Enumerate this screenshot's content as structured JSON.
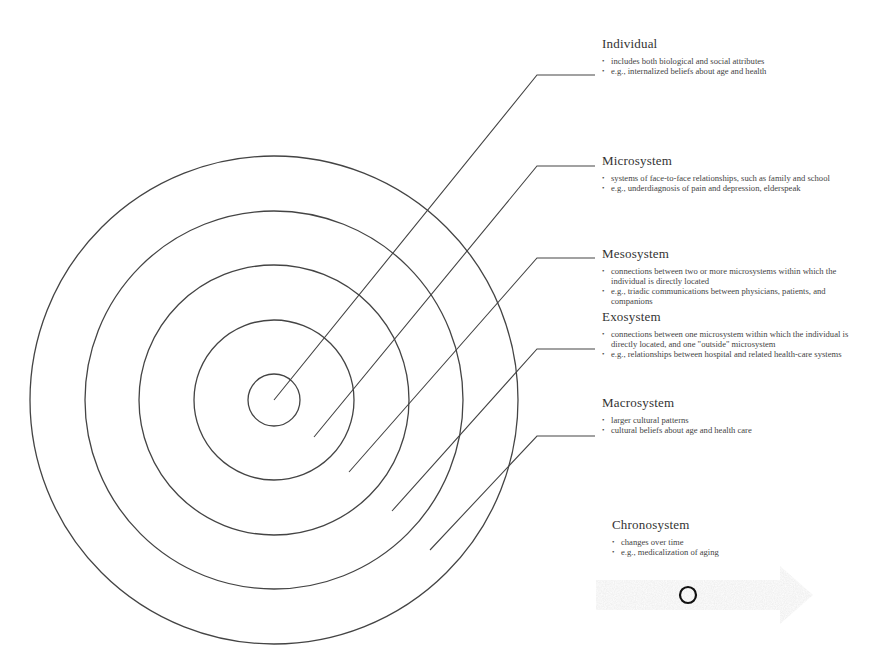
{
  "diagram": {
    "type": "concentric-circles",
    "center": [
      274,
      400
    ],
    "circles": [
      {
        "name": "Individual",
        "radius": 26
      },
      {
        "name": "Microsystem",
        "radius": 80
      },
      {
        "name": "Mesosystem",
        "radius": 135
      },
      {
        "name": "Exosystem",
        "radius": 189
      },
      {
        "name": "Macrosystem",
        "radius": 244
      }
    ],
    "line_color": "#444444"
  },
  "systems": {
    "individual": {
      "title": "Individual",
      "items": [
        "includes both biological and social attributes",
        "e.g., internalized beliefs about age and health"
      ]
    },
    "microsystem": {
      "title": "Microsystem",
      "items": [
        "systems of face-to-face relationships, such as family and school",
        "e.g., underdiagnosis of pain and depression, elderspeak"
      ]
    },
    "mesosystem": {
      "title": "Mesosystem",
      "items": [
        "connections between two or more microsystems within which the individual is directly located",
        "e.g., triadic communications between physicians, patients, and companions"
      ]
    },
    "exosystem": {
      "title": "Exosystem",
      "items": [
        "connections between one microsystem within which the individual is directly located, and one \"outside\" microsystem",
        "e.g., relationships between hospital and related health-care systems"
      ]
    },
    "macrosystem": {
      "title": "Macrosystem",
      "items": [
        "larger cultural patterns",
        "cultural beliefs about age and health care"
      ]
    },
    "chronosystem": {
      "title": "Chronosystem",
      "items": [
        "changes over time",
        "e.g., medicalization of aging"
      ]
    }
  }
}
